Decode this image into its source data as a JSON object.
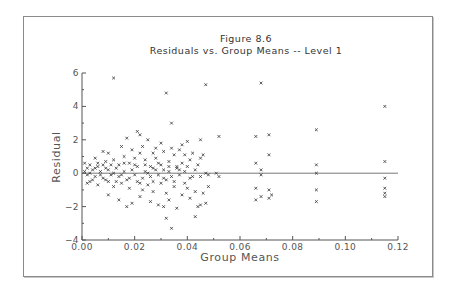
{
  "chart_data": {
    "type": "scatter",
    "title": "Figure 8.6",
    "subtitle": "Residuals vs. Group Means -- Level 1",
    "xlabel": "Group Means",
    "ylabel": "Residual",
    "xlim": [
      0.0,
      0.12
    ],
    "ylim": [
      -4,
      6
    ],
    "x_ticks": [
      "0.00",
      "0.02",
      "0.04",
      "0.06",
      "0.08",
      "0.10",
      "0.12"
    ],
    "y_ticks": [
      "-4",
      "-2",
      "0",
      "2",
      "4",
      "6"
    ],
    "grid": false,
    "legend": null,
    "reference_line": {
      "y": 0
    },
    "marker": "x",
    "points": [
      [
        0.012,
        5.7
      ],
      [
        0.032,
        4.8
      ],
      [
        0.047,
        5.3
      ],
      [
        0.068,
        5.4
      ],
      [
        0.034,
        3.0
      ],
      [
        0.089,
        2.6
      ],
      [
        0.115,
        4.0
      ],
      [
        0.021,
        2.5
      ],
      [
        0.022,
        2.3
      ],
      [
        0.025,
        2.0
      ],
      [
        0.017,
        2.1
      ],
      [
        0.045,
        2.0
      ],
      [
        0.052,
        2.2
      ],
      [
        0.071,
        2.3
      ],
      [
        0.066,
        2.2
      ],
      [
        0.04,
        1.9
      ],
      [
        0.038,
        1.7
      ],
      [
        0.03,
        1.8
      ],
      [
        0.028,
        1.5
      ],
      [
        0.015,
        1.6
      ],
      [
        0.01,
        1.2
      ],
      [
        0.008,
        1.3
      ],
      [
        0.005,
        0.9
      ],
      [
        0.071,
        1.1
      ],
      [
        0.089,
        0.5
      ],
      [
        0.115,
        0.7
      ],
      [
        0.066,
        0.6
      ],
      [
        0.045,
        0.9
      ],
      [
        0.046,
        1.1
      ],
      [
        0.041,
        0.8
      ],
      [
        0.035,
        1.1
      ],
      [
        0.003,
        0.5
      ],
      [
        0.006,
        0.6
      ],
      [
        0.009,
        0.7
      ],
      [
        0.012,
        0.8
      ],
      [
        0.014,
        0.5
      ],
      [
        0.016,
        1.0
      ],
      [
        0.018,
        0.6
      ],
      [
        0.02,
        0.9
      ],
      [
        0.022,
        1.2
      ],
      [
        0.024,
        0.8
      ],
      [
        0.026,
        0.4
      ],
      [
        0.028,
        0.9
      ],
      [
        0.03,
        0.5
      ],
      [
        0.033,
        0.7
      ],
      [
        0.036,
        0.4
      ],
      [
        0.038,
        0.6
      ],
      [
        0.001,
        0.1
      ],
      [
        0.002,
        -0.1
      ],
      [
        0.004,
        0.2
      ],
      [
        0.005,
        -0.2
      ],
      [
        0.007,
        0.1
      ],
      [
        0.008,
        -0.3
      ],
      [
        0.01,
        0.2
      ],
      [
        0.011,
        -0.1
      ],
      [
        0.013,
        0.3
      ],
      [
        0.014,
        -0.2
      ],
      [
        0.016,
        0.1
      ],
      [
        0.017,
        -0.4
      ],
      [
        0.019,
        0.2
      ],
      [
        0.02,
        -0.1
      ],
      [
        0.021,
        0.4
      ],
      [
        0.023,
        -0.3
      ],
      [
        0.024,
        0.1
      ],
      [
        0.026,
        -0.2
      ],
      [
        0.027,
        0.3
      ],
      [
        0.029,
        -0.1
      ],
      [
        0.031,
        0.2
      ],
      [
        0.032,
        -0.4
      ],
      [
        0.033,
        0.1
      ],
      [
        0.034,
        -0.2
      ],
      [
        0.036,
        0.3
      ],
      [
        0.037,
        -0.1
      ],
      [
        0.039,
        0.1
      ],
      [
        0.041,
        -0.3
      ],
      [
        0.043,
        0.2
      ],
      [
        0.045,
        -0.2
      ],
      [
        0.047,
        0.0
      ],
      [
        0.048,
        -0.1
      ],
      [
        0.052,
        -0.2
      ],
      [
        0.051,
        0.0
      ],
      [
        0.068,
        -0.1
      ],
      [
        0.068,
        0.2
      ],
      [
        0.115,
        -0.3
      ],
      [
        0.089,
        0.0
      ],
      [
        0.003,
        -0.5
      ],
      [
        0.006,
        -0.7
      ],
      [
        0.009,
        -0.4
      ],
      [
        0.012,
        -0.8
      ],
      [
        0.015,
        -0.6
      ],
      [
        0.018,
        -0.9
      ],
      [
        0.021,
        -0.5
      ],
      [
        0.023,
        -1.0
      ],
      [
        0.025,
        -0.7
      ],
      [
        0.027,
        -1.1
      ],
      [
        0.03,
        -0.6
      ],
      [
        0.032,
        -1.2
      ],
      [
        0.035,
        -0.8
      ],
      [
        0.038,
        -1.3
      ],
      [
        0.04,
        -0.9
      ],
      [
        0.043,
        -1.1
      ],
      [
        0.046,
        -1.2
      ],
      [
        0.048,
        -0.8
      ],
      [
        0.066,
        -0.9
      ],
      [
        0.068,
        -1.4
      ],
      [
        0.071,
        -1.0
      ],
      [
        0.072,
        -1.3
      ],
      [
        0.066,
        -1.6
      ],
      [
        0.089,
        -1.0
      ],
      [
        0.089,
        -1.7
      ],
      [
        0.115,
        -0.9
      ],
      [
        0.115,
        -1.2
      ],
      [
        0.115,
        -1.4
      ],
      [
        0.071,
        -1.5
      ],
      [
        0.01,
        -1.3
      ],
      [
        0.014,
        -1.6
      ],
      [
        0.017,
        -2.0
      ],
      [
        0.019,
        -1.8
      ],
      [
        0.022,
        -1.4
      ],
      [
        0.026,
        -1.7
      ],
      [
        0.029,
        -1.9
      ],
      [
        0.031,
        -2.0
      ],
      [
        0.033,
        -1.6
      ],
      [
        0.036,
        -2.1
      ],
      [
        0.041,
        -1.5
      ],
      [
        0.044,
        -2.0
      ],
      [
        0.045,
        -1.9
      ],
      [
        0.047,
        -1.8
      ],
      [
        0.032,
        -2.7
      ],
      [
        0.034,
        -3.3
      ],
      [
        0.043,
        -2.6
      ],
      [
        0.002,
        0.3
      ],
      [
        0.004,
        -0.4
      ],
      [
        0.006,
        0.4
      ],
      [
        0.007,
        -0.1
      ],
      [
        0.009,
        0.3
      ],
      [
        0.011,
        0.5
      ],
      [
        0.013,
        -0.5
      ],
      [
        0.016,
        0.6
      ],
      [
        0.018,
        -0.3
      ],
      [
        0.02,
        0.5
      ],
      [
        0.022,
        -0.6
      ],
      [
        0.024,
        0.5
      ],
      [
        0.025,
        0.0
      ],
      [
        0.027,
        -0.5
      ],
      [
        0.028,
        0.2
      ],
      [
        0.029,
        0.6
      ],
      [
        0.031,
        -0.3
      ],
      [
        0.033,
        0.4
      ],
      [
        0.035,
        -0.5
      ],
      [
        0.037,
        0.2
      ],
      [
        0.039,
        -0.6
      ],
      [
        0.04,
        0.4
      ],
      [
        0.042,
        -0.2
      ],
      [
        0.044,
        0.5
      ],
      [
        0.019,
        1.4
      ],
      [
        0.023,
        1.6
      ],
      [
        0.027,
        1.2
      ],
      [
        0.031,
        1.3
      ],
      [
        0.034,
        1.5
      ],
      [
        0.037,
        1.4
      ],
      [
        0.039,
        1.1
      ],
      [
        0.042,
        1.2
      ],
      [
        0.001,
        0.6
      ],
      [
        0.002,
        -0.6
      ],
      [
        0.003,
        0.0
      ],
      [
        0.005,
        0.3
      ],
      [
        0.008,
        0.5
      ],
      [
        0.01,
        -0.5
      ],
      [
        0.012,
        0.0
      ],
      [
        0.015,
        -0.1
      ]
    ]
  }
}
